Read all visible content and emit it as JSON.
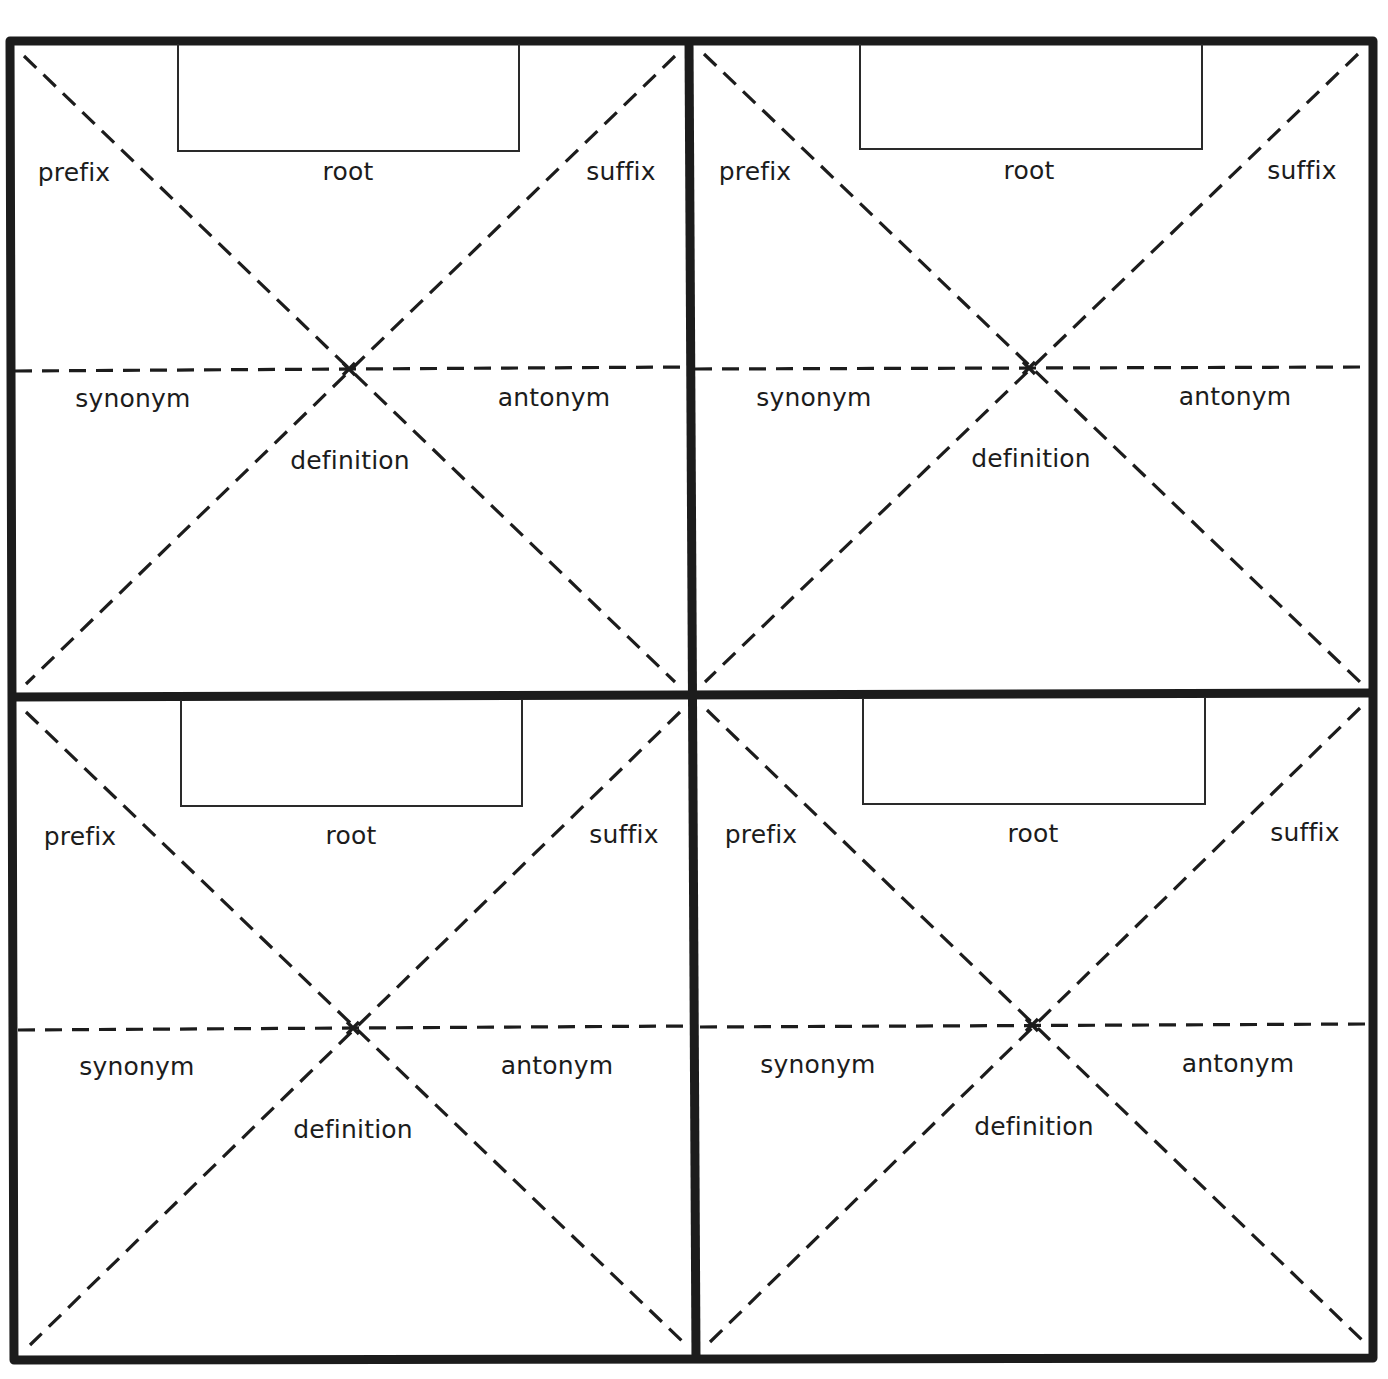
{
  "worksheet": {
    "title": "Word map graphic organizer (4 copies)",
    "colors": {
      "line": "#1c1c1c",
      "background": "#ffffff"
    },
    "panels": [
      {
        "id": "top-left",
        "root_box": {
          "value": ""
        },
        "labels": {
          "prefix": "prefix",
          "root": "root",
          "suffix": "suffix",
          "synonym": "synonym",
          "antonym": "antonym",
          "definition": "definition"
        }
      },
      {
        "id": "top-right",
        "root_box": {
          "value": ""
        },
        "labels": {
          "prefix": "prefix",
          "root": "root",
          "suffix": "suffix",
          "synonym": "synonym",
          "antonym": "antonym",
          "definition": "definition"
        }
      },
      {
        "id": "bottom-left",
        "root_box": {
          "value": ""
        },
        "labels": {
          "prefix": "prefix",
          "root": "root",
          "suffix": "suffix",
          "synonym": "synonym",
          "antonym": "antonym",
          "definition": "definition"
        }
      },
      {
        "id": "bottom-right",
        "root_box": {
          "value": ""
        },
        "labels": {
          "prefix": "prefix",
          "root": "root",
          "suffix": "suffix",
          "synonym": "synonym",
          "antonym": "antonym",
          "definition": "definition"
        }
      }
    ]
  }
}
